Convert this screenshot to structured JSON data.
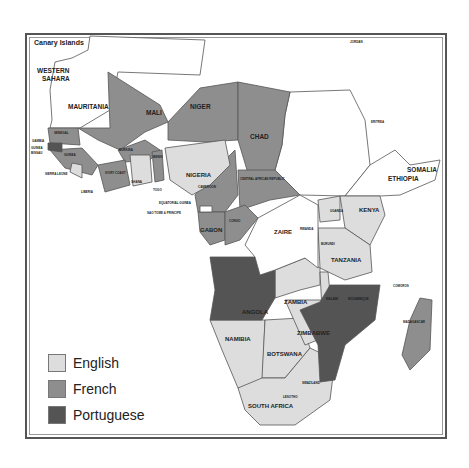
{
  "map": {
    "colors": {
      "english": "#dddddd",
      "french": "#8e8e8e",
      "portuguese": "#545454",
      "none": "#ffffff",
      "border": "#555555"
    },
    "labels": {
      "canary": "Canary Islands",
      "western_sahara_1": "WESTERN",
      "western_sahara_2": "SAHARA",
      "mauritania": "MAURITANIA",
      "mali": "MALI",
      "niger": "NIGER",
      "chad": "CHAD",
      "senegal": "SENEGAL",
      "gambia": "GAMBIA",
      "guinea_bissau_1": "GUINEA",
      "guinea_bissau_2": "BISSAU",
      "guinea": "GUINEA",
      "sierra_leone": "SIERRA LEONE",
      "liberia": "LIBERIA",
      "burkina": "BURKINA",
      "ivory_coast": "IVORY COAST",
      "ghana": "GHANA",
      "togo": "TOGO",
      "benin": "BENIN",
      "nigeria": "NIGERIA",
      "cameroon": "CAMEROON",
      "car": "CENTRAL AFRICAN REPUBLIC",
      "eq_guinea": "EQUATORIAL GUINEA",
      "sao_tome": "SAO TOME & PRINCIPE",
      "gabon": "GABON",
      "congo": "CONGO",
      "zaire": "ZAIRE",
      "rwanda": "RWANDA",
      "burundi": "BURUNDI",
      "uganda": "UGANDA",
      "kenya": "KENYA",
      "tanzania": "TANZANIA",
      "somalia": "SOMALIA",
      "ethiopia": "ETHIOPIA",
      "eritrea": "ERITREA",
      "jordan": "JORDAN",
      "angola": "ANGOLA",
      "zambia": "ZAMBIA",
      "malawi": "MALAWI",
      "mozambique": "MOZAMBIQUE",
      "comoros": "COMOROS",
      "madagascar": "MADAGASCAR",
      "namibia": "NAMIBIA",
      "zimbabwe": "ZIMBABWE",
      "botswana": "BOTSWANA",
      "swaziland": "SWAZILAND",
      "lesotho": "LESOTHO",
      "south_africa": "SOUTH AFRICA"
    }
  },
  "legend": {
    "items": [
      {
        "label": "English",
        "color": "#dddddd"
      },
      {
        "label": "French",
        "color": "#8e8e8e"
      },
      {
        "label": "Portuguese",
        "color": "#545454"
      }
    ]
  }
}
